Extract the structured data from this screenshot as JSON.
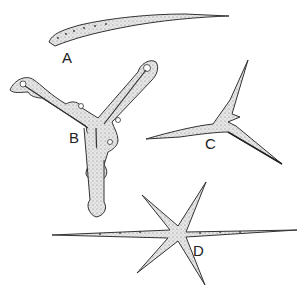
{
  "figure": {
    "labels": {
      "a": "A",
      "b": "B",
      "c": "C",
      "d": "D"
    },
    "colors": {
      "outline": "#333333",
      "fill": "#e4e4e4",
      "stipple": "#555555",
      "background": "#ffffff"
    }
  }
}
